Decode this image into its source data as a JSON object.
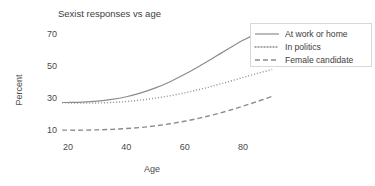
{
  "chart_data": {
    "type": "line",
    "title": "Sexist responses vs age",
    "xlabel": "Age",
    "ylabel": "Percent",
    "xlim": [
      18,
      91
    ],
    "ylim": [
      6,
      76
    ],
    "xticks": [
      20,
      40,
      60,
      80
    ],
    "yticks": [
      10,
      30,
      50,
      70
    ],
    "xtick_labels": [
      "20",
      "40",
      "60",
      "80"
    ],
    "ytick_labels": [
      "10",
      "30",
      "50",
      "70"
    ],
    "grid": false,
    "legend_position": "upper right",
    "x": [
      18,
      20,
      25,
      30,
      35,
      40,
      45,
      50,
      55,
      60,
      65,
      70,
      75,
      80,
      85,
      90
    ],
    "series": [
      {
        "name": "At work or home",
        "style": "solid",
        "color": "#8c8c8c",
        "values": [
          27.2,
          27.2,
          27.4,
          28.0,
          29.1,
          30.8,
          33.2,
          36.3,
          40.2,
          44.8,
          49.9,
          55.3,
          60.8,
          66.1,
          70.2,
          73.2
        ]
      },
      {
        "name": "In politics",
        "style": "dotted",
        "color": "#8c8c8c",
        "values": [
          27.0,
          26.9,
          26.8,
          26.9,
          27.2,
          27.8,
          28.7,
          29.9,
          31.4,
          33.2,
          35.3,
          37.7,
          40.2,
          42.8,
          45.4,
          47.8
        ]
      },
      {
        "name": "Female candidate",
        "style": "dashed",
        "color": "#8c8c8c",
        "values": [
          9.9,
          9.9,
          9.9,
          10.1,
          10.4,
          10.9,
          11.6,
          12.6,
          13.9,
          15.5,
          17.4,
          19.6,
          22.1,
          24.9,
          27.9,
          31.0
        ]
      }
    ]
  },
  "legend": {
    "entries": [
      {
        "label": "At work or home",
        "style": "solid"
      },
      {
        "label": "In politics",
        "style": "dotted"
      },
      {
        "label": "Female candidate",
        "style": "dashed"
      }
    ]
  }
}
